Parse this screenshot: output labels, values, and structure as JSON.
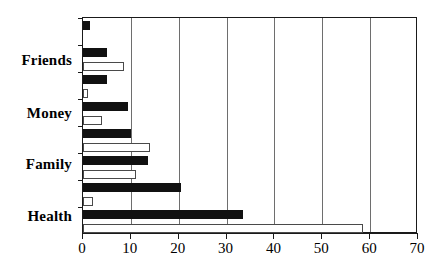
{
  "chart_data": {
    "type": "bar",
    "orientation": "horizontal",
    "title": "",
    "subtitle": "",
    "xlabel": "",
    "ylabel": "",
    "xlim": [
      0,
      70
    ],
    "xticks": [
      0,
      10,
      20,
      30,
      40,
      50,
      60,
      70
    ],
    "xticklabels": [
      "0",
      "10",
      "20",
      "30",
      "40",
      "50",
      "60",
      "70"
    ],
    "grid": "vertical",
    "legend": "none",
    "categories": [
      "Friends",
      "Money",
      "Family",
      "Health"
    ],
    "series": [
      {
        "name": "dark-series",
        "color": "#111111",
        "values": [
          5,
          5,
          13.5,
          33.5
        ]
      },
      {
        "name": "light-series",
        "color": "#ffffff",
        "values": [
          8.5,
          4,
          11,
          58.5
        ]
      }
    ],
    "bars": [
      {
        "index": 0,
        "group": "",
        "style": "dark",
        "value": 1.5
      },
      {
        "index": 1,
        "group": "",
        "style": "light",
        "value": 0
      },
      {
        "index": 2,
        "group": "Friends",
        "style": "dark",
        "value": 5
      },
      {
        "index": 3,
        "group": "Friends",
        "style": "light",
        "value": 8.5
      },
      {
        "index": 4,
        "group": "",
        "style": "dark",
        "value": 5
      },
      {
        "index": 5,
        "group": "",
        "style": "light",
        "value": 1
      },
      {
        "index": 6,
        "group": "Money",
        "style": "dark",
        "value": 9.5
      },
      {
        "index": 7,
        "group": "Money",
        "style": "light",
        "value": 4
      },
      {
        "index": 8,
        "group": "",
        "style": "dark",
        "value": 10
      },
      {
        "index": 9,
        "group": "",
        "style": "light",
        "value": 14
      },
      {
        "index": 10,
        "group": "Family",
        "style": "dark",
        "value": 13.5
      },
      {
        "index": 11,
        "group": "Family",
        "style": "light",
        "value": 11
      },
      {
        "index": 12,
        "group": "",
        "style": "dark",
        "value": 20.5
      },
      {
        "index": 13,
        "group": "",
        "style": "light",
        "value": 2
      },
      {
        "index": 14,
        "group": "Health",
        "style": "dark",
        "value": 33.5
      },
      {
        "index": 15,
        "group": "Health",
        "style": "light",
        "value": 58.5
      }
    ],
    "axis_colors": {
      "frame": "#1a1a1a",
      "gridline": "#6e6e6e",
      "dark_bar": "#111111",
      "light_bar_fill": "#ffffff",
      "light_bar_edge": "#4a4a4a"
    }
  }
}
